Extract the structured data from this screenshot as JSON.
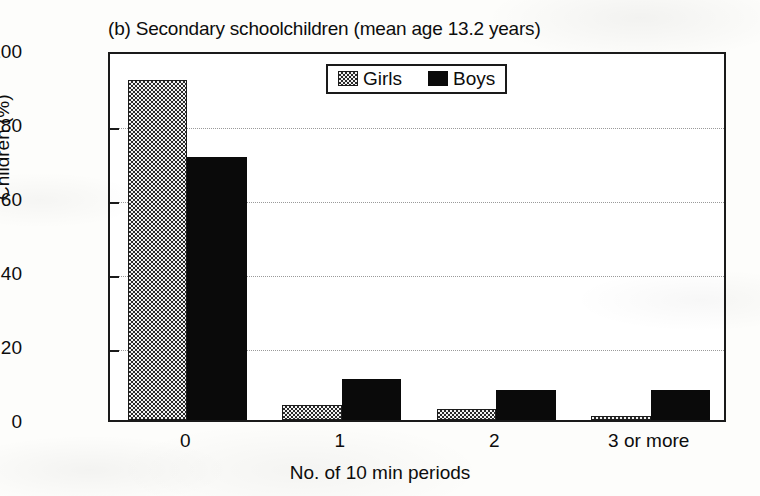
{
  "chart_data": {
    "type": "bar",
    "title": "(b) Secondary schoolchildren (mean age 13.2 years)",
    "xlabel": "No. of 10 min periods",
    "ylabel": "Children (%)",
    "categories": [
      "0",
      "1",
      "2",
      "3 or more"
    ],
    "series": [
      {
        "name": "Girls",
        "values": [
          92,
          4,
          3,
          1
        ],
        "pattern": "checkered",
        "color": "#e9e9e9"
      },
      {
        "name": "Boys",
        "values": [
          71,
          11,
          8,
          8
        ],
        "pattern": "solid",
        "color": "#0a0a0a"
      }
    ],
    "ylim": [
      0,
      100
    ],
    "yticks": [
      0,
      20,
      40,
      60,
      80,
      100
    ],
    "ytick_labels": [
      "0",
      "20",
      "40",
      "60",
      "80",
      "100"
    ],
    "grid": true,
    "grid_style": "dotted-horizontal",
    "legend_position": "top-center-inside",
    "frame": true
  },
  "legend": {
    "entries": [
      {
        "label": "Girls",
        "swatch": "checkered-swatch"
      },
      {
        "label": "Boys",
        "swatch": "solid-black-swatch"
      }
    ]
  }
}
